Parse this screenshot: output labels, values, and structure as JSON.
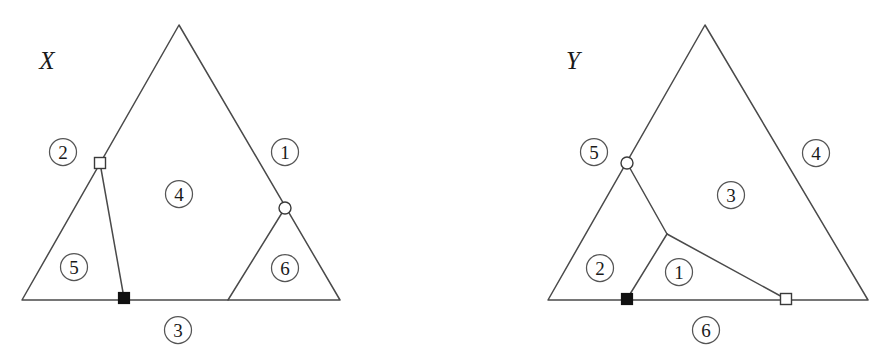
{
  "page": {
    "background_color": "#ffffff",
    "width": 893,
    "height": 361,
    "line_color": "#4a4a4a",
    "text_color": "#1a1a1a"
  },
  "figures": [
    {
      "id": "figure-x",
      "title": "X",
      "title_position": {
        "x": 47,
        "y": 60
      },
      "triangle": {
        "apex": {
          "x": 179,
          "y": 25
        },
        "base_left": {
          "x": 22,
          "y": 300
        },
        "base_right": {
          "x": 340,
          "y": 300
        }
      },
      "markers": [
        {
          "name": "open-square-marker",
          "shape": "open-square",
          "x": 100,
          "y": 163,
          "size": 11
        },
        {
          "name": "open-circle-marker",
          "shape": "open-circle",
          "x": 285,
          "y": 208,
          "radius": 6
        },
        {
          "name": "filled-square-marker",
          "shape": "filled-square",
          "x": 124,
          "y": 298,
          "size": 11
        }
      ],
      "inner_edges": [
        {
          "name": "edge-square-to-filled-square",
          "x1": 100,
          "y1": 163,
          "x2": 124,
          "y2": 298
        },
        {
          "name": "edge-circle-to-base",
          "x1": 285,
          "y1": 208,
          "x2": 228,
          "y2": 300
        }
      ],
      "region_badges": [
        {
          "label": "1",
          "x": 285,
          "y": 152
        },
        {
          "label": "2",
          "x": 63,
          "y": 152
        },
        {
          "label": "3",
          "x": 178,
          "y": 330
        },
        {
          "label": "4",
          "x": 179,
          "y": 194
        },
        {
          "label": "5",
          "x": 74,
          "y": 267
        },
        {
          "label": "6",
          "x": 285,
          "y": 268
        }
      ]
    },
    {
      "id": "figure-y",
      "title": "Y",
      "title_position": {
        "x": 573,
        "y": 60
      },
      "triangle": {
        "apex": {
          "x": 705,
          "y": 25
        },
        "base_left": {
          "x": 548,
          "y": 300
        },
        "base_right": {
          "x": 868,
          "y": 300
        }
      },
      "markers": [
        {
          "name": "open-circle-marker",
          "shape": "open-circle",
          "x": 627,
          "y": 163,
          "radius": 6
        },
        {
          "name": "filled-square-marker",
          "shape": "filled-square",
          "x": 627,
          "y": 299,
          "size": 11
        },
        {
          "name": "open-square-marker",
          "shape": "open-square",
          "x": 786,
          "y": 299,
          "size": 11
        }
      ],
      "junction": {
        "name": "inner-junction-node",
        "x": 667,
        "y": 234
      },
      "inner_edges": [
        {
          "name": "edge-circle-to-junction",
          "x1": 627,
          "y1": 163,
          "x2": 667,
          "y2": 234
        },
        {
          "name": "edge-junction-to-filled-square",
          "x1": 667,
          "y1": 234,
          "x2": 627,
          "y2": 299
        },
        {
          "name": "edge-junction-to-open-square",
          "x1": 667,
          "y1": 234,
          "x2": 786,
          "y2": 299
        }
      ],
      "region_badges": [
        {
          "label": "1",
          "x": 679,
          "y": 272
        },
        {
          "label": "2",
          "x": 600,
          "y": 268
        },
        {
          "label": "3",
          "x": 731,
          "y": 195
        },
        {
          "label": "4",
          "x": 816,
          "y": 153
        },
        {
          "label": "5",
          "x": 594,
          "y": 152
        },
        {
          "label": "6",
          "x": 706,
          "y": 330
        }
      ]
    }
  ]
}
